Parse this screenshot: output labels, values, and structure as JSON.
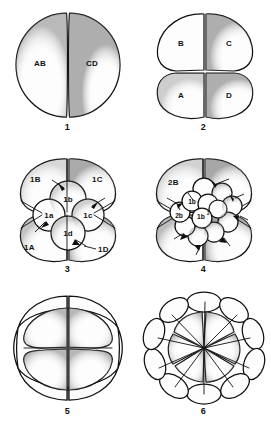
{
  "plate": {
    "title": "Spiral cleavage stages",
    "background_color": "#ffffff",
    "ink_color": "#101010"
  },
  "panels": [
    {
      "caption": "1",
      "name": "two-cell-stage",
      "cells": [
        {
          "label": "AB",
          "x": 40,
          "y": 62
        },
        {
          "label": "CD",
          "x": 90,
          "y": 62
        }
      ]
    },
    {
      "caption": "2",
      "name": "four-cell-stage",
      "cells": [
        {
          "label": "B",
          "x": 47,
          "y": 42
        },
        {
          "label": "C",
          "x": 93,
          "y": 42
        },
        {
          "label": "A",
          "x": 47,
          "y": 90
        },
        {
          "label": "D",
          "x": 93,
          "y": 90
        }
      ]
    },
    {
      "caption": "3",
      "name": "eight-cell-stage",
      "cells": [
        {
          "label": "1B",
          "x": 32,
          "y": 35
        },
        {
          "label": "1C",
          "x": 100,
          "y": 35
        },
        {
          "label": "1A",
          "x": 32,
          "y": 101
        },
        {
          "label": "1D",
          "x": 104,
          "y": 101
        },
        {
          "label": "1b",
          "x": 68,
          "y": 52
        },
        {
          "label": "1a",
          "x": 48,
          "y": 70
        },
        {
          "label": "1c",
          "x": 88,
          "y": 70
        },
        {
          "label": "1d",
          "x": 68,
          "y": 88
        }
      ]
    },
    {
      "caption": "4",
      "name": "sixteen-cell-stage",
      "cells": [
        {
          "label": "2B",
          "x": 38,
          "y": 36
        },
        {
          "label": "1b",
          "x": 60,
          "y": 62
        },
        {
          "label": "2b",
          "x": 43,
          "y": 79
        },
        {
          "label": "1b",
          "x": 66,
          "y": 79,
          "superscript": "2"
        }
      ]
    },
    {
      "caption": "5",
      "name": "later-cleavage-lateral-view",
      "cells": []
    },
    {
      "caption": "6",
      "name": "rosette-stage-animal-pole-view",
      "cells": []
    }
  ]
}
